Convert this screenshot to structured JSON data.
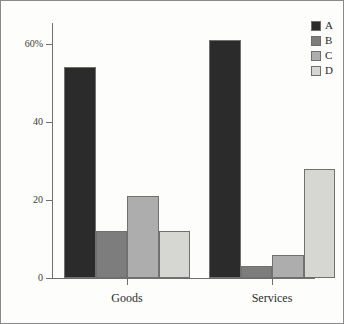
{
  "chart_data": {
    "type": "bar",
    "title": "",
    "subtitle": "",
    "xlabel": "",
    "ylabel": "",
    "categories": [
      "Goods",
      "Services"
    ],
    "series": [
      {
        "name": "A",
        "color": "#2b2b2b",
        "values": [
          54,
          61
        ]
      },
      {
        "name": "B",
        "color": "#7d7d7d",
        "values": [
          12,
          3
        ]
      },
      {
        "name": "C",
        "color": "#adadad",
        "values": [
          21,
          6
        ]
      },
      {
        "name": "D",
        "color": "#d6d6d2",
        "values": [
          12,
          28
        ]
      }
    ],
    "ylim": [
      0,
      65
    ],
    "yticks": [
      0,
      20,
      40,
      60
    ],
    "ytick_labels": [
      "0",
      "20",
      "40",
      "60%"
    ],
    "xtick_labels": [
      "Goods",
      "Services"
    ],
    "grid": false,
    "legend_position": "top-right",
    "legend_entries": [
      "A",
      "B",
      "C",
      "D"
    ]
  },
  "axes": {
    "y": {
      "ticks": [
        {
          "label": "60%",
          "value": 60
        },
        {
          "label": "40",
          "value": 40
        },
        {
          "label": "20",
          "value": 20
        },
        {
          "label": "0",
          "value": 0
        }
      ]
    },
    "x": {
      "ticks": [
        {
          "label": "Goods"
        },
        {
          "label": "Services"
        }
      ]
    }
  },
  "legend": {
    "items": [
      {
        "label": "A",
        "color": "#2b2b2b"
      },
      {
        "label": "B",
        "color": "#7d7d7d"
      },
      {
        "label": "C",
        "color": "#adadad"
      },
      {
        "label": "D",
        "color": "#d6d6d2"
      }
    ]
  },
  "bars": [
    {
      "group": "Goods",
      "series": "A",
      "value": 54,
      "color": "#2b2b2b",
      "left": 63,
      "width": 32
    },
    {
      "group": "Goods",
      "series": "B",
      "value": 12,
      "color": "#7d7d7d",
      "left": 95,
      "width": 31
    },
    {
      "group": "Goods",
      "series": "C",
      "value": 21,
      "color": "#adadad",
      "left": 126,
      "width": 32
    },
    {
      "group": "Goods",
      "series": "D",
      "value": 12,
      "color": "#d6d6d2",
      "left": 158,
      "width": 31
    },
    {
      "group": "Services",
      "series": "A",
      "value": 61,
      "color": "#2b2b2b",
      "left": 208,
      "width": 32
    },
    {
      "group": "Services",
      "series": "B",
      "value": 3,
      "color": "#7d7d7d",
      "left": 240,
      "width": 31
    },
    {
      "group": "Services",
      "series": "C",
      "value": 6,
      "color": "#adadad",
      "left": 271,
      "width": 32
    },
    {
      "group": "Services",
      "series": "D",
      "value": 28,
      "color": "#d6d6d2",
      "left": 303,
      "width": 31
    }
  ]
}
